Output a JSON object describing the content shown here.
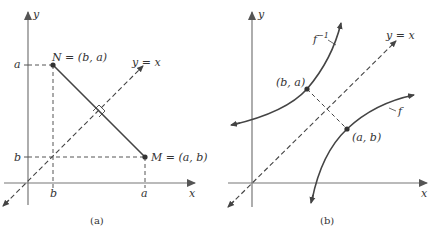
{
  "panels": [
    {
      "id": "a",
      "caption": "(a)",
      "axis_x_label": "x",
      "axis_y_label": "y",
      "diagonal_label": "y = x",
      "point_N_label": "N = (b, a)",
      "point_M_label": "M = (a, b)",
      "tick_y_top": "a",
      "tick_y_bottom": "b",
      "tick_x_left": "b",
      "tick_x_right": "a"
    },
    {
      "id": "b",
      "caption": "(b)",
      "axis_x_label": "x",
      "axis_y_label": "y",
      "diagonal_label": "y = x",
      "curve_inverse_label": "f",
      "curve_inverse_sup": "−1",
      "curve_f_label": "f",
      "point_upper_label": "(b, a)",
      "point_lower_label": "(a, b)"
    }
  ],
  "colors": {
    "stroke": "#444444",
    "axis": "#777777",
    "text": "#333333"
  }
}
